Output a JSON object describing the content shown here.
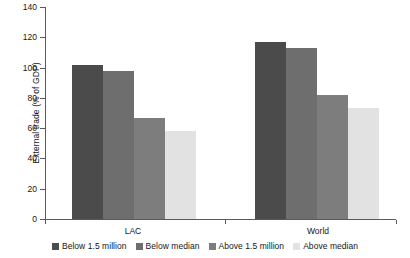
{
  "chart_data": {
    "type": "bar",
    "title": "",
    "xlabel": "",
    "ylabel": "External trade (% of GDP)",
    "categories": [
      "LAC",
      "World"
    ],
    "ylim": [
      0,
      140
    ],
    "yticks": [
      0,
      20,
      40,
      60,
      80,
      100,
      120,
      140
    ],
    "ytick_labels": [
      "0",
      "20",
      "40",
      "60",
      "80",
      "100",
      "120",
      "140"
    ],
    "grid": false,
    "legend_position": "bottom",
    "series": [
      {
        "name": "Below 1.5 million",
        "color": "#4b4b4b",
        "values": [
          102,
          117
        ]
      },
      {
        "name": "Below median",
        "color": "#6e6e6e",
        "values": [
          98,
          113
        ]
      },
      {
        "name": "Above 1.5 million",
        "color": "#7d7d7d",
        "values": [
          67,
          82
        ]
      },
      {
        "name": "Above median",
        "color": "#e2e2e2",
        "values": [
          58,
          73
        ]
      }
    ]
  }
}
